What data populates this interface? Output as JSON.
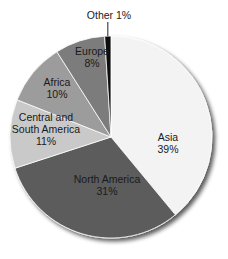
{
  "chart_data": {
    "type": "pie",
    "title": "",
    "start_angle_deg": 0,
    "direction": "clockwise",
    "categories": [
      "Asia",
      "North America",
      "Central and South America",
      "Africa",
      "Europe",
      "Other"
    ],
    "values": [
      39,
      31,
      11,
      10,
      8,
      1
    ],
    "unit": "%",
    "labels": [
      {
        "lines": [
          "Asia",
          "39%"
        ]
      },
      {
        "lines": [
          "North America",
          "31%"
        ]
      },
      {
        "lines": [
          "Central and",
          "South America",
          "11%"
        ]
      },
      {
        "lines": [
          "Africa",
          "10%"
        ]
      },
      {
        "lines": [
          "Europe",
          "8%"
        ]
      },
      {
        "lines": [
          "Other 1%"
        ],
        "outside": true
      }
    ],
    "colors": [
      "#f3f3f3",
      "#5c5c5c",
      "#c9c9c9",
      "#9c9c9c",
      "#7b7b7b",
      "#111111"
    ],
    "legend": "none",
    "grid": false
  },
  "layout": {
    "cx": 111,
    "cy": 137,
    "r": 101,
    "shadow_color": "#555555"
  }
}
